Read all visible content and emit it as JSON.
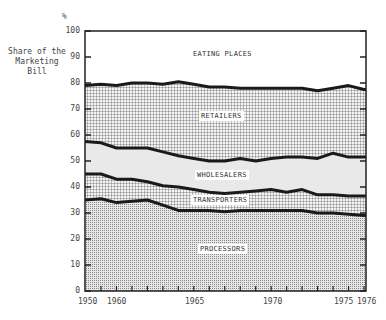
{
  "chart_data": {
    "type": "area",
    "title": "",
    "ylabel": "Share of the\nMarketing\nBill",
    "yunit": "%",
    "xlabel": "",
    "ylim": [
      0,
      100
    ],
    "yticks": [
      "0",
      "10",
      "20",
      "30",
      "40",
      "50",
      "60",
      "70",
      "80",
      "90",
      "100"
    ],
    "xtick_labels": [
      "1950",
      "1960",
      "1965",
      "1970",
      "1975",
      "1976"
    ],
    "x": [
      1950,
      1959,
      1960,
      1961,
      1962,
      1963,
      1964,
      1965,
      1966,
      1967,
      1968,
      1969,
      1970,
      1971,
      1972,
      1973,
      1974,
      1975,
      1976
    ],
    "stacked": true,
    "series": [
      {
        "name": "PROCESSORS",
        "values": [
          35,
          35.5,
          34,
          34.5,
          35,
          33,
          31,
          31,
          31,
          30.5,
          31,
          31,
          31,
          31,
          31,
          30,
          30,
          29.5,
          29
        ]
      },
      {
        "name": "TRANSPORTERS",
        "values": [
          10,
          9.5,
          9,
          8.5,
          7,
          7.5,
          9,
          8,
          7,
          7,
          7,
          7.5,
          8,
          7,
          8,
          7,
          7,
          7,
          7.5
        ]
      },
      {
        "name": "WHOLESALERS",
        "values": [
          12.5,
          12,
          12,
          12,
          13,
          13,
          12,
          12,
          12,
          12.5,
          13,
          11.5,
          12,
          13.5,
          12.5,
          14,
          16,
          15,
          15
        ]
      },
      {
        "name": "RETAILERS",
        "values": [
          21.5,
          22.5,
          24,
          25,
          25,
          26,
          28.5,
          28.5,
          28.5,
          28.5,
          27,
          28,
          27,
          26.5,
          26.5,
          26,
          25,
          27.5,
          26
        ]
      },
      {
        "name": "EATING PLACES",
        "values": [
          21,
          20.5,
          21,
          20,
          20,
          20.5,
          19.5,
          20.5,
          21.5,
          21.5,
          22,
          22,
          22,
          22,
          22,
          23,
          22,
          21,
          22.5
        ]
      }
    ],
    "grid": false,
    "legend": "inline labels"
  },
  "labels": {
    "eating": "EATING PLACES",
    "retailers": "RETAILERS",
    "wholesalers": "WHOLESALERS",
    "transporters": "TRANSPORTERS",
    "processors": "PROCESSORS"
  }
}
